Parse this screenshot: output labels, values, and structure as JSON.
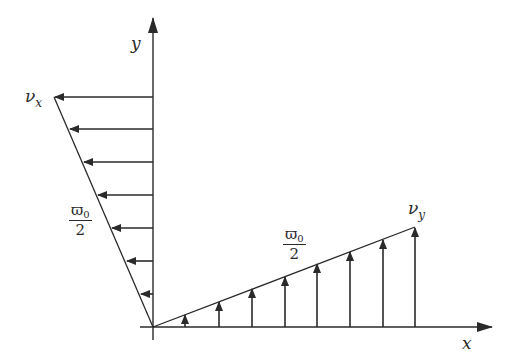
{
  "diagram": {
    "type": "velocity-distribution",
    "axes": {
      "x_label": "x",
      "y_label": "y"
    },
    "labels": {
      "vx": {
        "main": "ν",
        "sub": "x"
      },
      "vy": {
        "main": "ν",
        "sub": "y"
      },
      "slope_left": {
        "num": "ϖ",
        "num_sub": "0",
        "den": "2"
      },
      "slope_right": {
        "num": "ϖ",
        "num_sub": "0",
        "den": "2"
      }
    },
    "colors": {
      "stroke": "#2a2a2a",
      "background": "#ffffff"
    },
    "origin": [
      153,
      327
    ],
    "horizontal_arrows_y": [
      97,
      129,
      162,
      195,
      228,
      261,
      294
    ],
    "vertical_arrows_x": [
      185,
      219,
      252,
      285,
      317,
      350,
      383,
      415
    ]
  }
}
